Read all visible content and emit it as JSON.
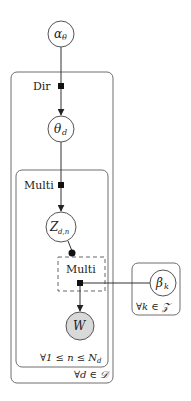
{
  "diagram": {
    "type": "factor-graph / plate notation",
    "nodes": [
      {
        "id": "alpha",
        "label": "α",
        "sub": "θ",
        "observed": false
      },
      {
        "id": "theta",
        "label": "θ",
        "sub": "d",
        "observed": false
      },
      {
        "id": "z",
        "label": "Z",
        "sub": "d,n",
        "observed": false
      },
      {
        "id": "w",
        "label": "W",
        "sub": "",
        "observed": true
      },
      {
        "id": "beta",
        "label": "β",
        "sub": "k",
        "observed": false
      }
    ],
    "factors": [
      {
        "id": "dir",
        "label": "Dir"
      },
      {
        "id": "multi_z",
        "label": "Multi"
      },
      {
        "id": "multi_w",
        "label": "Multi",
        "gated_by": "z"
      }
    ],
    "edges": [
      {
        "from": "alpha",
        "to": "dir"
      },
      {
        "from": "dir",
        "to": "theta"
      },
      {
        "from": "theta",
        "to": "multi_z"
      },
      {
        "from": "multi_z",
        "to": "z"
      },
      {
        "from": "z",
        "to": "multi_w",
        "style": "gate"
      },
      {
        "from": "multi_w",
        "to": "w"
      },
      {
        "from": "beta",
        "to": "multi_w"
      }
    ],
    "plates": [
      {
        "id": "docs",
        "label": "∀d ∈ 𝒟"
      },
      {
        "id": "words",
        "label": "∀1 ≤ n ≤ N",
        "label_sub": "d"
      },
      {
        "id": "topics",
        "label": "∀k ∈ 𝒵"
      }
    ],
    "colors": {
      "observed_fill": "#d9d9d9",
      "factor_fill": "#111111"
    }
  }
}
